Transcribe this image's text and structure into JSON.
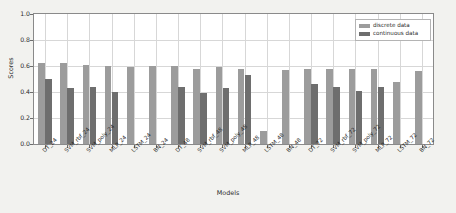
{
  "chart_data": {
    "type": "bar",
    "title": "",
    "xlabel": "Models",
    "ylabel": "Scores",
    "ylim": [
      0.0,
      1.0
    ],
    "yticks": [
      "0.0",
      "0.2",
      "0.4",
      "0.6",
      "0.8",
      "1.0"
    ],
    "ytick_values": [
      0.0,
      0.2,
      0.4,
      0.6,
      0.8,
      1.0
    ],
    "grid": true,
    "legend_position": "upper right",
    "categories": [
      "DT_24",
      "SVM_rbf_24",
      "SVM_poly_24",
      "MLP_24",
      "LSTM_24",
      "BN_24",
      "DT_48",
      "SVM_rbf_48",
      "SVM_poly_48",
      "MLP_48",
      "LSTM_48",
      "BN_48",
      "DT_72",
      "SVM_rbf_72",
      "SVM_poly_72",
      "MLP_72",
      "LSTM_72",
      "BN_72"
    ],
    "series": [
      {
        "name": "discrete data",
        "color": "#9c9c9c",
        "values": [
          0.62,
          0.62,
          0.61,
          0.6,
          0.59,
          0.6,
          0.6,
          0.58,
          0.59,
          0.58,
          0.1,
          0.57,
          0.58,
          0.58,
          0.58,
          0.58,
          0.48,
          0.56
        ]
      },
      {
        "name": "continuous data",
        "color": "#6e6e6e",
        "values": [
          0.5,
          0.43,
          0.44,
          0.4,
          0.0,
          0.0,
          0.44,
          0.39,
          0.43,
          0.53,
          0.0,
          0.0,
          0.46,
          0.44,
          0.41,
          0.44,
          0.0,
          0.0
        ]
      }
    ]
  },
  "legend": {
    "items": [
      {
        "label": "discrete data"
      },
      {
        "label": "continuous data"
      }
    ]
  },
  "colors": {
    "discrete": "#9c9c9c",
    "continuous": "#6e6e6e",
    "background": "#f2f2ef",
    "plot_background": "#ffffff",
    "grid": "#d7d7d7",
    "axis": "#8a8a8a"
  }
}
